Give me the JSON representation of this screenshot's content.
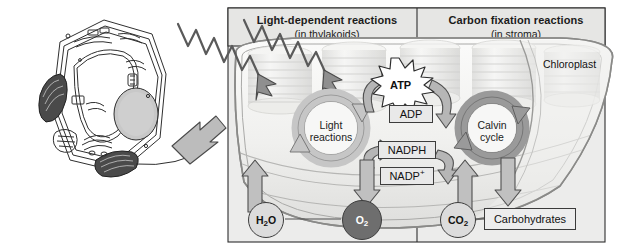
{
  "figure": {
    "title_left": "Light-dependent reactions",
    "subtitle_left": "(in thylakoids)",
    "title_right": "Carbon fixation reactions",
    "subtitle_right": "(in stroma)",
    "organelle_label": "Chloroplast"
  },
  "cycles": {
    "light": {
      "line1": "Light",
      "line2": "reactions"
    },
    "calvin": {
      "line1": "Calvin",
      "line2": "cycle"
    }
  },
  "carriers": {
    "atp": "ATP",
    "adp": "ADP",
    "nadph": "NADPH",
    "nadp_plus": "NADP",
    "nadp_charge": "+"
  },
  "inputs_outputs": {
    "water": {
      "formula": "H",
      "sub": "2",
      "tail": "O"
    },
    "oxygen": {
      "formula": "O",
      "sub": "2"
    },
    "carbon_dioxide": {
      "formula": "CO",
      "sub": "2"
    },
    "carbohydrates": "Carbohydrates"
  },
  "colors": {
    "arrow_light": "#b9b9b9",
    "arrow_dark": "#8c8c8c",
    "arrow_stroke": "#4a4a4a",
    "panel_bg": "#e8e8e6",
    "stroma": "#f2f2f0",
    "oxygen_fill": "#6e6e6e",
    "outline": "#3d3d3d"
  },
  "diagram_data": {
    "type": "diagram",
    "subject": "Photosynthesis overview in a chloroplast",
    "nodes": [
      "Light reactions",
      "Calvin cycle",
      "ATP",
      "ADP",
      "NADPH",
      "NADP+",
      "H2O",
      "O2",
      "CO2",
      "Carbohydrates"
    ],
    "flows": [
      {
        "from": "H2O",
        "to": "Light reactions"
      },
      {
        "from": "Light reactions",
        "to": "O2"
      },
      {
        "from": "Light reactions",
        "to": "ATP"
      },
      {
        "from": "ATP",
        "to": "Calvin cycle"
      },
      {
        "from": "Calvin cycle",
        "to": "ADP"
      },
      {
        "from": "ADP",
        "to": "Light reactions"
      },
      {
        "from": "Light reactions",
        "to": "NADPH"
      },
      {
        "from": "NADPH",
        "to": "Calvin cycle"
      },
      {
        "from": "Calvin cycle",
        "to": "NADP+"
      },
      {
        "from": "NADP+",
        "to": "Light reactions"
      },
      {
        "from": "CO2",
        "to": "Calvin cycle"
      },
      {
        "from": "Calvin cycle",
        "to": "Carbohydrates"
      },
      {
        "from": "Sunlight",
        "to": "Light reactions"
      }
    ]
  }
}
